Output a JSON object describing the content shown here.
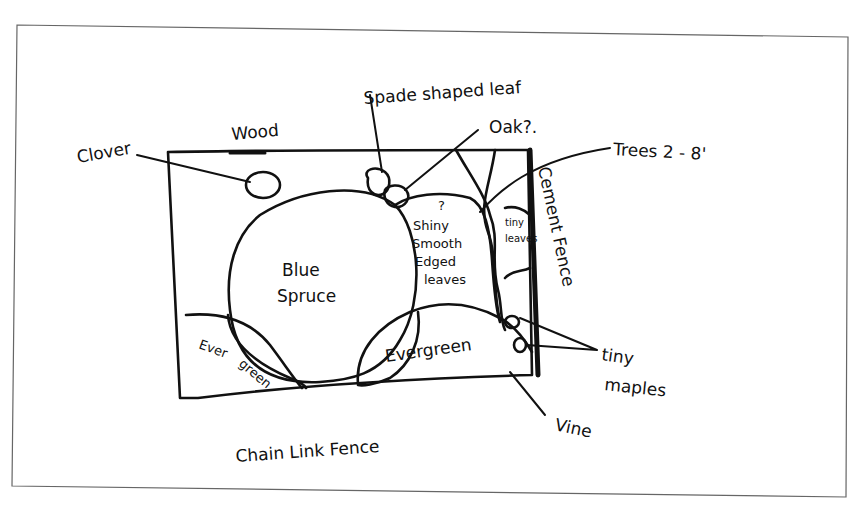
{
  "diagram": {
    "type": "hand-drawn site sketch",
    "colors": {
      "ink": "#111111",
      "paper": "#ffffff",
      "frame": "#555555"
    },
    "labels": {
      "clover": "Clover",
      "wood": "Wood",
      "spade_leaf": "Spade shaped leaf",
      "oak": "Oak?.",
      "trees": "Trees 2 - 8'",
      "cement_fence": "Cement Fence",
      "shiny_q": "?",
      "shiny_1": "Shiny",
      "shiny_2": "Smooth",
      "shiny_3": "Edged",
      "shiny_4": "leaves",
      "tiny_leaves_1": "tiny",
      "tiny_leaves_2": "leaves",
      "blue_spruce_1": "Blue",
      "blue_spruce_2": "Spruce",
      "evergreen_left_1": "Ever",
      "evergreen_left_2": "green",
      "evergreen_right": "Evergreen",
      "tiny_maples_1": "tiny",
      "tiny_maples_2": "maples",
      "vine": "Vine",
      "chain_link_fence": "Chain Link Fence"
    }
  }
}
